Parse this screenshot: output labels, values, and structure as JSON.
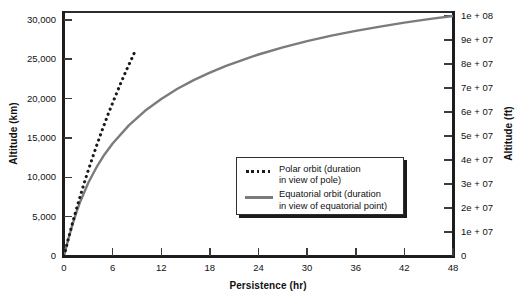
{
  "chart_data": {
    "type": "line",
    "title": "",
    "xlabel": "Persistence (hr)",
    "ylabel": "Altitude (km)",
    "ylabel_right": "Altitude (ft)",
    "xlim": [
      0,
      48
    ],
    "ylim": [
      0,
      31000
    ],
    "ylim_right": [
      0,
      101700000
    ],
    "grid": false,
    "legend_position": "center-right-inside",
    "x_ticks": [
      "0",
      "6",
      "12",
      "18",
      "24",
      "30",
      "36",
      "42",
      "48"
    ],
    "x_tick_values": [
      0,
      6,
      12,
      18,
      24,
      30,
      36,
      42,
      48
    ],
    "y_ticks_left": [
      "0",
      "5,000",
      "10,000",
      "15,000",
      "20,000",
      "25,000",
      "30,000"
    ],
    "y_tick_values_left": [
      0,
      5000,
      10000,
      15000,
      20000,
      25000,
      30000
    ],
    "y_ticks_right": [
      "0",
      "1e + 07",
      "2e + 07",
      "3e + 07",
      "4e + 07",
      "5e + 07",
      "6e + 07",
      "7e + 07",
      "8e + 07",
      "9e + 07",
      "1e + 08"
    ],
    "y_tick_values_right": [
      0,
      10000000,
      20000000,
      30000000,
      40000000,
      50000000,
      60000000,
      70000000,
      80000000,
      90000000,
      100000000
    ],
    "series": [
      {
        "name": "Polar orbit (duration in view of pole)",
        "style": "dotted",
        "color": "#1a1a1a",
        "x": [
          0,
          0.5,
          1,
          1.5,
          2,
          2.5,
          3,
          3.5,
          4,
          4.5,
          5,
          5.5,
          6,
          6.5,
          7,
          7.5,
          8,
          8.5,
          8.9
        ],
        "y": [
          0,
          2050,
          4000,
          5850,
          7600,
          9300,
          10900,
          12450,
          13950,
          15400,
          16800,
          18150,
          19450,
          20700,
          21950,
          23150,
          24300,
          25400,
          26350
        ]
      },
      {
        "name": "Equatorial orbit (duration in view of equatorial point)",
        "style": "solid",
        "color": "#7b7b7b",
        "x": [
          0,
          0.5,
          1,
          1.5,
          2,
          3,
          4,
          5,
          6,
          8,
          10,
          12,
          14,
          16,
          18,
          20,
          22,
          24,
          27,
          30,
          33,
          36,
          39,
          42,
          45,
          48
        ],
        "y": [
          0,
          2000,
          3850,
          5450,
          6900,
          9300,
          11250,
          12900,
          14300,
          16600,
          18450,
          19950,
          21250,
          22350,
          23300,
          24150,
          24900,
          25600,
          26500,
          27300,
          28000,
          28600,
          29150,
          29650,
          30100,
          30500
        ]
      }
    ],
    "legend": [
      {
        "swatch": "dotted",
        "line1": "Polar orbit (duration",
        "line2": "in view of pole)"
      },
      {
        "swatch": "solid",
        "line1": "Equatorial orbit (duration",
        "line2": "in view of equatorial point)"
      }
    ]
  },
  "colors": {
    "axis": "#1d1d1d",
    "polar_line": "#1a1a1a",
    "equatorial_line": "#7b7b7b",
    "background": "#ffffff",
    "legend_border": "#2f2f2f"
  }
}
